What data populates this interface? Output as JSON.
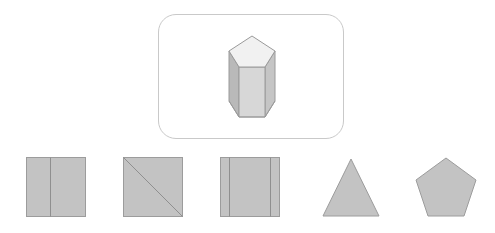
{
  "page": {
    "background_color": "#ffffff"
  },
  "prompt": {
    "card": {
      "name": "prompt-card",
      "border_color": "#c9c9c9",
      "fill_color": "#ffffff",
      "corner_radius": 18,
      "x": 158,
      "y": 14,
      "width": 186,
      "height": 125
    },
    "figure": {
      "name": "pentagonal-prism",
      "type": "3d-solid",
      "label": "pentagonal prism",
      "faces": {
        "top_pentagon_color": "#f0f0f0",
        "front_face_color": "#d6d6d6",
        "left_face_color": "#b8b8b8",
        "right_face_color": "#c6c6c6"
      },
      "edge_color": "#9a9a9a",
      "center_x": 250,
      "top_y": 35,
      "bottom_y": 116
    }
  },
  "options": {
    "count": 5,
    "fill_color": "#c3c3c3",
    "stroke_color": "#9c9c9c",
    "inner_line_color": "#8f8f8f",
    "items": [
      {
        "index": 1,
        "name": "option-square-one-vertical-line",
        "shape": "square",
        "description": "square divided by one vertical line left of center",
        "inner_lines": 1,
        "size": 59
      },
      {
        "index": 2,
        "name": "option-square-diagonal",
        "shape": "square",
        "description": "square divided by a diagonal from top-left to bottom-right",
        "inner_lines": 1,
        "size": 59
      },
      {
        "index": 3,
        "name": "option-square-two-vertical-lines",
        "shape": "square",
        "description": "square divided by two vertical lines near the edges",
        "inner_lines": 2,
        "size": 59
      },
      {
        "index": 4,
        "name": "option-triangle",
        "shape": "triangle",
        "description": "upright isosceles triangle",
        "inner_lines": 0,
        "size": 59
      },
      {
        "index": 5,
        "name": "option-pentagon",
        "shape": "pentagon",
        "description": "regular pentagon point up",
        "inner_lines": 0,
        "size": 59
      }
    ]
  }
}
